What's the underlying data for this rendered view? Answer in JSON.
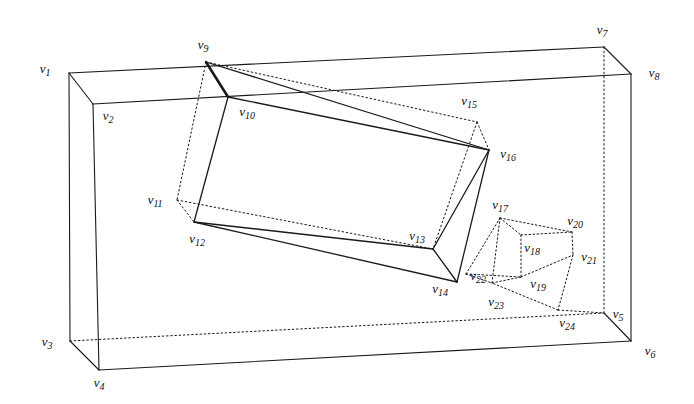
{
  "figure": {
    "title": "",
    "background_color": "#ffffff",
    "stroke_color": "#1a1a1a",
    "width": 694,
    "height": 404
  },
  "labels": [
    {
      "id": "v1",
      "prefix": "v",
      "sub": "1",
      "x": 45,
      "y": 70
    },
    {
      "id": "v2",
      "prefix": "v",
      "sub": "2",
      "x": 108,
      "y": 117
    },
    {
      "id": "v3",
      "prefix": "v",
      "sub": "3",
      "x": 47,
      "y": 343
    },
    {
      "id": "v4",
      "prefix": "v",
      "sub": "4",
      "x": 99,
      "y": 384
    },
    {
      "id": "v5",
      "prefix": "v",
      "sub": "5",
      "x": 618,
      "y": 315
    },
    {
      "id": "v6",
      "prefix": "v",
      "sub": "6",
      "x": 650,
      "y": 352
    },
    {
      "id": "v7",
      "prefix": "v",
      "sub": "7",
      "x": 602,
      "y": 31
    },
    {
      "id": "v8",
      "prefix": "v",
      "sub": "8",
      "x": 654,
      "y": 74
    },
    {
      "id": "v9",
      "prefix": "v",
      "sub": "9",
      "x": 203,
      "y": 46
    },
    {
      "id": "v10",
      "prefix": "v",
      "sub": "10",
      "x": 247,
      "y": 113
    },
    {
      "id": "v11",
      "prefix": "v",
      "sub": "11",
      "x": 155,
      "y": 201
    },
    {
      "id": "v12",
      "prefix": "v",
      "sub": "12",
      "x": 197,
      "y": 240
    },
    {
      "id": "v13",
      "prefix": "v",
      "sub": "13",
      "x": 417,
      "y": 237
    },
    {
      "id": "v14",
      "prefix": "v",
      "sub": "14",
      "x": 440,
      "y": 290
    },
    {
      "id": "v15",
      "prefix": "v",
      "sub": "15",
      "x": 469,
      "y": 102
    },
    {
      "id": "v16",
      "prefix": "v",
      "sub": "16",
      "x": 508,
      "y": 155
    },
    {
      "id": "v17",
      "prefix": "v",
      "sub": "17",
      "x": 500,
      "y": 206
    },
    {
      "id": "v18",
      "prefix": "v",
      "sub": "18",
      "x": 532,
      "y": 249
    },
    {
      "id": "v19",
      "prefix": "v",
      "sub": "19",
      "x": 538,
      "y": 285
    },
    {
      "id": "v20",
      "prefix": "v",
      "sub": "20",
      "x": 575,
      "y": 222
    },
    {
      "id": "v21",
      "prefix": "v",
      "sub": "21",
      "x": 589,
      "y": 258
    },
    {
      "id": "v22",
      "prefix": "v",
      "sub": "22",
      "x": 478,
      "y": 277
    },
    {
      "id": "v23",
      "prefix": "v",
      "sub": "23",
      "x": 496,
      "y": 303
    },
    {
      "id": "v24",
      "prefix": "v",
      "sub": "24",
      "x": 567,
      "y": 324
    }
  ],
  "points": {
    "v1": [
      69,
      73
    ],
    "v2": [
      93,
      104
    ],
    "v3": [
      70,
      341
    ],
    "v4": [
      99,
      370
    ],
    "v5": [
      604,
      313
    ],
    "v6": [
      631,
      341
    ],
    "v7": [
      604,
      47
    ],
    "v8": [
      631,
      74
    ],
    "v9": [
      206,
      62
    ],
    "v10": [
      228,
      97
    ],
    "v11": [
      177,
      200
    ],
    "v12": [
      194,
      222
    ],
    "v13": [
      433,
      249
    ],
    "v14": [
      457,
      282
    ],
    "v15": [
      477,
      122
    ],
    "v16": [
      489,
      150
    ],
    "v17": [
      500,
      218
    ],
    "v18": [
      521,
      235
    ],
    "v19": [
      521,
      277
    ],
    "v20": [
      572,
      232
    ],
    "v21": [
      573,
      255
    ],
    "v22": [
      466,
      274
    ],
    "v23": [
      492,
      283
    ],
    "v24": [
      558,
      310
    ]
  },
  "edges": {
    "outer_box_solid": [
      [
        "v1",
        "v7"
      ],
      [
        "v1",
        "v2"
      ],
      [
        "v1",
        "v3"
      ],
      [
        "v2",
        "v8"
      ],
      [
        "v2",
        "v4"
      ],
      [
        "v3",
        "v4"
      ],
      [
        "v4",
        "v6"
      ],
      [
        "v7",
        "v8"
      ],
      [
        "v8",
        "v6"
      ],
      [
        "v6",
        "v5"
      ]
    ],
    "outer_box_dotted": [
      [
        "v7",
        "v5"
      ],
      [
        "v3",
        "v5"
      ]
    ],
    "block_solid": [
      [
        "v9",
        "v10"
      ],
      [
        "v10",
        "v12"
      ],
      [
        "v12",
        "v14"
      ],
      [
        "v10",
        "v16"
      ],
      [
        "v16",
        "v14"
      ],
      [
        "v14",
        "v13"
      ],
      [
        "v13",
        "v12"
      ],
      [
        "v16",
        "v13"
      ],
      [
        "v9",
        "v16"
      ]
    ],
    "block_dotted": [
      [
        "v9",
        "v11"
      ],
      [
        "v11",
        "v12"
      ],
      [
        "v11",
        "v13"
      ],
      [
        "v9",
        "v15"
      ],
      [
        "v15",
        "v16"
      ],
      [
        "v15",
        "v13"
      ]
    ],
    "cube_dotted": [
      [
        "v17",
        "v20"
      ],
      [
        "v20",
        "v21"
      ],
      [
        "v21",
        "v24"
      ],
      [
        "v24",
        "v23"
      ],
      [
        "v23",
        "v17"
      ],
      [
        "v17",
        "v18"
      ],
      [
        "v18",
        "v20"
      ],
      [
        "v18",
        "v19"
      ],
      [
        "v19",
        "v21"
      ],
      [
        "v19",
        "v23"
      ],
      [
        "v22",
        "v17"
      ],
      [
        "v22",
        "v23"
      ],
      [
        "v22",
        "v19"
      ]
    ],
    "cube_link_dotted": [
      [
        "v24",
        "v5"
      ]
    ]
  }
}
